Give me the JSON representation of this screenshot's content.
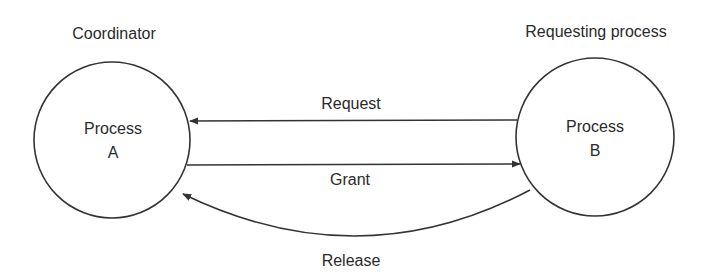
{
  "diagram": {
    "nodes": [
      {
        "id": "A",
        "role_label": "Coordinator",
        "line1": "Process",
        "line2": "A"
      },
      {
        "id": "B",
        "role_label": "Requesting process",
        "line1": "Process",
        "line2": "B"
      }
    ],
    "edges": [
      {
        "from": "B",
        "to": "A",
        "label": "Request"
      },
      {
        "from": "A",
        "to": "B",
        "label": "Grant"
      },
      {
        "from": "B",
        "to": "A",
        "label": "Release"
      }
    ],
    "colors": {
      "stroke": "#333333",
      "text": "#2a2a2a",
      "background": "#ffffff"
    }
  }
}
